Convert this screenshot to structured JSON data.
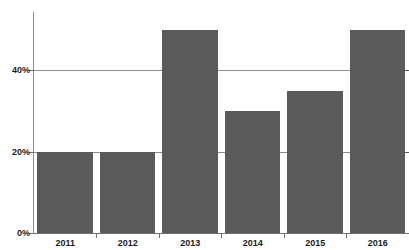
{
  "chart_data": {
    "type": "bar",
    "title": "",
    "xlabel": "",
    "ylabel": "",
    "categories": [
      "2011",
      "2012",
      "2013",
      "2014",
      "2015",
      "2016"
    ],
    "values": [
      20,
      20,
      50,
      30,
      35,
      50
    ],
    "value_suffix": "%",
    "ylim": [
      0,
      55
    ],
    "yticks": [
      0,
      20,
      40
    ],
    "ytick_labels": [
      "0%",
      "20%",
      "40%"
    ],
    "grid": true,
    "gridlines_at": [
      20,
      40
    ],
    "legend": false,
    "legend_position": "none",
    "series": [
      {
        "name": "",
        "color": "#5a5a5a",
        "values": [
          20,
          20,
          50,
          30,
          35,
          50
        ]
      }
    ],
    "bar_color": "#5a5a5a",
    "axis_color": "#8c8c8c",
    "text_color": "#1b1b1b",
    "background": "#ffffff"
  }
}
